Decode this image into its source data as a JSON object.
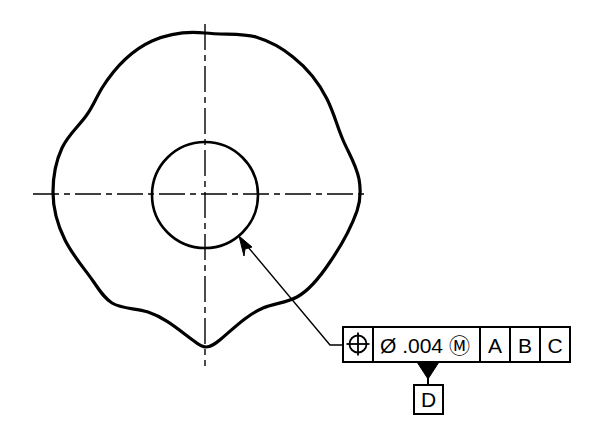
{
  "drawing": {
    "title": "GD&T Position Tolerance Drawing",
    "background_color": "#ffffff",
    "line_color": "#000000",
    "outline": {
      "name": "lobed-outer-profile",
      "description": "irregular wavy lobed closed contour",
      "stroke_width": 3.2
    },
    "inner_circle": {
      "name": "inner-bore-circle",
      "center_x": 205,
      "center_y": 195,
      "radius": 53,
      "stroke_width": 2.6
    },
    "centerlines": {
      "name": "center-lines",
      "horizontal": {
        "x1": 33,
        "y1": 194,
        "x2": 369,
        "y2": 194
      },
      "vertical": {
        "x1": 205,
        "y1": 24,
        "x2": 205,
        "y2": 366
      },
      "dash_pattern": "26,5,6,5",
      "stroke_width": 1.4
    },
    "leader": {
      "name": "leader-line",
      "arrow_tip_x": 239,
      "arrow_tip_y": 237,
      "elbow_x": 330,
      "elbow_y": 345,
      "landing_x": 343,
      "landing_y": 345,
      "stroke_width": 1.4
    }
  },
  "feature_control_frame": {
    "name": "feature-control-frame",
    "x": 343,
    "y": 327,
    "width": 227,
    "height": 35,
    "stroke_width": 2,
    "cells": [
      {
        "name": "geometric-characteristic-symbol",
        "type": "symbol",
        "symbol": "position-symbol",
        "label": "⌖",
        "width": 30
      },
      {
        "name": "tolerance-value-cell",
        "type": "text",
        "label": "Ø .004 Ⓜ",
        "diameter_symbol": "Ø",
        "tolerance": ".004",
        "material_modifier": "Ⓜ",
        "modifier_meaning": "MMC",
        "width": 107
      },
      {
        "name": "primary-datum-cell",
        "type": "text",
        "label": "A",
        "width": 30
      },
      {
        "name": "secondary-datum-cell",
        "type": "text",
        "label": "B",
        "width": 30
      },
      {
        "name": "tertiary-datum-cell",
        "type": "text",
        "label": "C",
        "width": 30
      }
    ]
  },
  "datum_feature_symbol": {
    "name": "datum-feature-symbol-d",
    "letter": "D",
    "box_x": 414,
    "box_y": 385,
    "box_size": 29,
    "triangle_apex_x": 428,
    "triangle_top_y": 362,
    "triangle_bottom_y": 379,
    "triangle_half_width": 11,
    "leader_x": 428,
    "stroke_width": 2
  }
}
